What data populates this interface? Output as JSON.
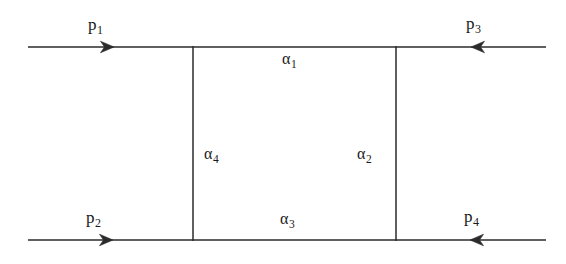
{
  "figure": {
    "background_color": "#ffffff",
    "line_color": "#2b2b2b",
    "text_color": "#1a1a1a"
  },
  "labels": {
    "p1": {
      "base": "p",
      "sub": "1"
    },
    "p2": {
      "base": "p",
      "sub": "2"
    },
    "p3": {
      "base": "p",
      "sub": "3"
    },
    "p4": {
      "base": "p",
      "sub": "4"
    },
    "a1": {
      "base": "α",
      "sub": "1"
    },
    "a2": {
      "base": "α",
      "sub": "2"
    },
    "a3": {
      "base": "α",
      "sub": "3"
    },
    "a4": {
      "base": "α",
      "sub": "4"
    }
  },
  "geometry": {
    "top_line_y": 47,
    "bottom_line_y": 240,
    "left_vertical_x": 193,
    "right_vertical_x": 396,
    "line_start_x": 28,
    "line_end_x": 546,
    "arrows": [
      {
        "name": "p1-arrow",
        "x": 113,
        "y": 47,
        "direction": "right"
      },
      {
        "name": "p3-arrow",
        "x": 472,
        "y": 47,
        "direction": "left"
      },
      {
        "name": "p2-arrow",
        "x": 112,
        "y": 240,
        "direction": "right"
      },
      {
        "name": "p4-arrow",
        "x": 471,
        "y": 240,
        "direction": "left"
      }
    ]
  }
}
